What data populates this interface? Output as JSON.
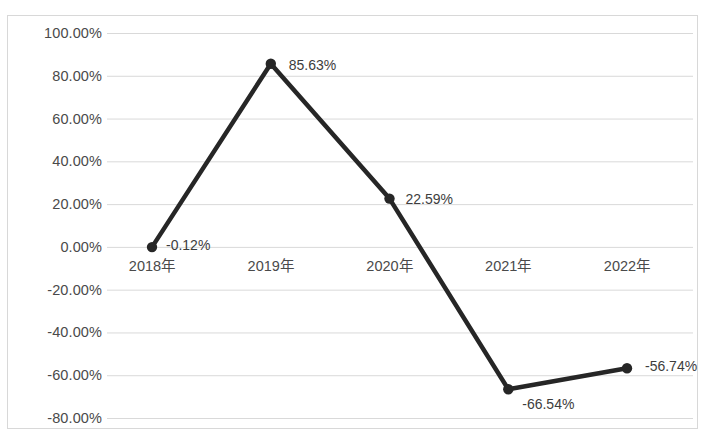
{
  "chart_data": {
    "type": "line",
    "title": "",
    "subtitle": "",
    "xlabel": "",
    "ylabel": "",
    "categories": [
      "2018年",
      "2019年",
      "2020年",
      "2021年",
      "2022年"
    ],
    "values": [
      -0.12,
      85.63,
      22.59,
      -66.54,
      -56.74
    ],
    "data_labels": [
      "-0.12%",
      "85.63%",
      "22.59%",
      "-66.54%",
      "-56.74%"
    ],
    "series": [
      {
        "name": "",
        "values": [
          -0.12,
          85.63,
          22.59,
          -66.54,
          -56.74
        ]
      }
    ],
    "unit": "%",
    "ylim": [
      -80,
      100
    ],
    "ytick_step": 20,
    "ytick_labels": [
      "100.00%",
      "80.00%",
      "60.00%",
      "40.00%",
      "20.00%",
      "0.00%",
      "-20.00%",
      "-40.00%",
      "-60.00%",
      "-80.00%"
    ],
    "ytick_values": [
      100,
      80,
      60,
      40,
      20,
      0,
      -20,
      -40,
      -60,
      -80
    ],
    "grid": true,
    "grid_axis": "y",
    "legend": false,
    "legend_position": "none",
    "marker": "circle",
    "colors": {
      "line": "#262626",
      "marker": "#262626",
      "grid": "#d9d9d9",
      "border": "#d8d8d8",
      "tick_text": "#4a4a4a",
      "label_text": "#3d3d3d",
      "background": "#ffffff"
    },
    "label_offsets": [
      {
        "dx": 14,
        "dy": -3
      },
      {
        "dx": 18,
        "dy": 0
      },
      {
        "dx": 16,
        "dy": -1
      },
      {
        "dx": 14,
        "dy": 14
      },
      {
        "dx": 18,
        "dy": -3
      }
    ]
  }
}
